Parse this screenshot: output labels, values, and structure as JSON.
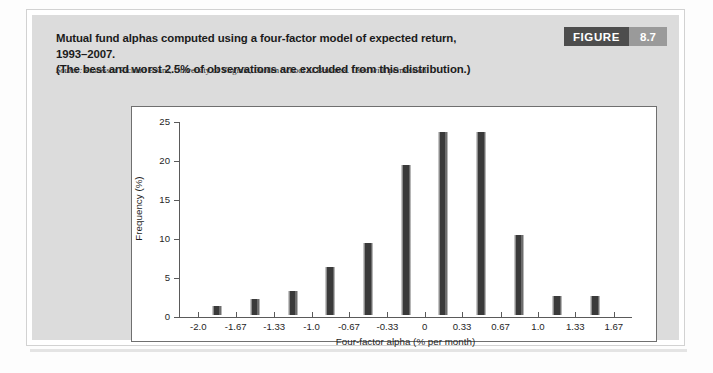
{
  "figure": {
    "title_line1": "Mutual fund alphas computed using a four-factor model of expected return, 1993–2007.",
    "title_line2": "(The best and worst 2.5% of observations are excluded from this distribution.)",
    "source_label": "Source:",
    "source_text": " Professor Richard Evans, University of Virginia, Darden School of Business. Used with permission.",
    "badge_word": "FIGURE",
    "badge_number": "8.7",
    "colors": {
      "panel": "#dcdcdc",
      "badge_word_bg": "#4d4d4d",
      "badge_num_bg": "#9a9a9a",
      "bar": "#3a3a3a",
      "plot_bg": "#ffffff",
      "axis": "#5a5a5a"
    }
  },
  "chart_data": {
    "type": "bar",
    "title": "Mutual fund alphas computed using a four-factor model of expected return, 1993–2007.",
    "xlabel": "Four-factor alpha (% per month)",
    "ylabel": "Frequency (%)",
    "xlim": [
      -2.17,
      1.83
    ],
    "ylim": [
      0,
      25
    ],
    "grid": false,
    "legend": null,
    "xticks": [
      "-2.0",
      "-1.67",
      "-1.33",
      "-1.0",
      "-0.67",
      "-0.33",
      "0",
      "0.33",
      "0.67",
      "1.0",
      "1.33",
      "1.67"
    ],
    "xtick_values": [
      -2.0,
      -1.67,
      -1.33,
      -1.0,
      -0.67,
      -0.33,
      0,
      0.33,
      0.67,
      1.0,
      1.33,
      1.67
    ],
    "yticks": [
      "0",
      "5",
      "10",
      "15",
      "20",
      "25"
    ],
    "ytick_values": [
      0,
      5,
      10,
      15,
      20,
      25
    ],
    "bin_centers": [
      -1.835,
      -1.5,
      -1.165,
      -0.835,
      -0.5,
      -0.165,
      0.165,
      0.5,
      0.835,
      1.165,
      1.5
    ],
    "categories": [
      "-2.0 to -1.67",
      "-1.67 to -1.33",
      "-1.33 to -1.0",
      "-1.0 to -0.67",
      "-0.67 to -0.33",
      "-0.33 to 0",
      "0 to 0.33",
      "0.33 to 0.67",
      "0.67 to 1.0",
      "1.0 to 1.33",
      "1.33 to 1.67"
    ],
    "values": [
      1.1,
      2.1,
      3.1,
      6.2,
      9.2,
      19.2,
      23.4,
      23.4,
      10.3,
      2.4,
      2.4
    ]
  }
}
